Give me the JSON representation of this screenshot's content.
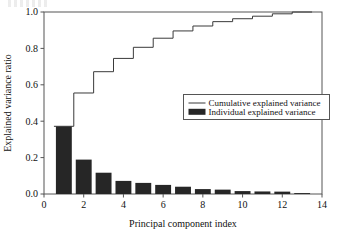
{
  "chart_data": {
    "type": "bar",
    "title": "",
    "xlabel": "Principal component index",
    "ylabel": "Explained variance ratio",
    "xlim": [
      0,
      14
    ],
    "ylim": [
      0.0,
      1.0
    ],
    "xticks": [
      0,
      2,
      4,
      6,
      8,
      10,
      12,
      14
    ],
    "xticklabels": [
      "0",
      "2",
      "4",
      "6",
      "8",
      "10",
      "12",
      "14"
    ],
    "yticks": [
      0.0,
      0.2,
      0.4,
      0.6,
      0.8,
      1.0
    ],
    "yticklabels": [
      "0.0",
      "0.2",
      "0.4",
      "0.6",
      "0.8",
      "1.0"
    ],
    "grid": false,
    "legend_position": "center-right",
    "categories": [
      1,
      2,
      3,
      4,
      5,
      6,
      7,
      8,
      9,
      10,
      11,
      12,
      13
    ],
    "series": [
      {
        "name": "Individual explained variance",
        "type": "bar",
        "color": "#262626",
        "values": [
          0.372,
          0.189,
          0.117,
          0.072,
          0.061,
          0.05,
          0.04,
          0.027,
          0.024,
          0.016,
          0.014,
          0.013,
          0.005
        ]
      },
      {
        "name": "Cumulative explained variance",
        "type": "step",
        "color": "#3a3a3a",
        "values": [
          0.372,
          0.555,
          0.672,
          0.745,
          0.806,
          0.856,
          0.896,
          0.923,
          0.947,
          0.963,
          0.977,
          0.99,
          1.0
        ]
      }
    ]
  },
  "legend": {
    "entries": [
      {
        "label": "Cumulative explained variance",
        "marker": "line"
      },
      {
        "label": "Individual explained variance",
        "marker": "bar"
      }
    ]
  },
  "axes": {
    "x_title": "Principal component index",
    "y_title": "Explained variance ratio"
  },
  "colors": {
    "bar": "#262626",
    "line": "#3a3a3a",
    "frame": "#555555",
    "text": "#111111",
    "background": "#ffffff"
  }
}
